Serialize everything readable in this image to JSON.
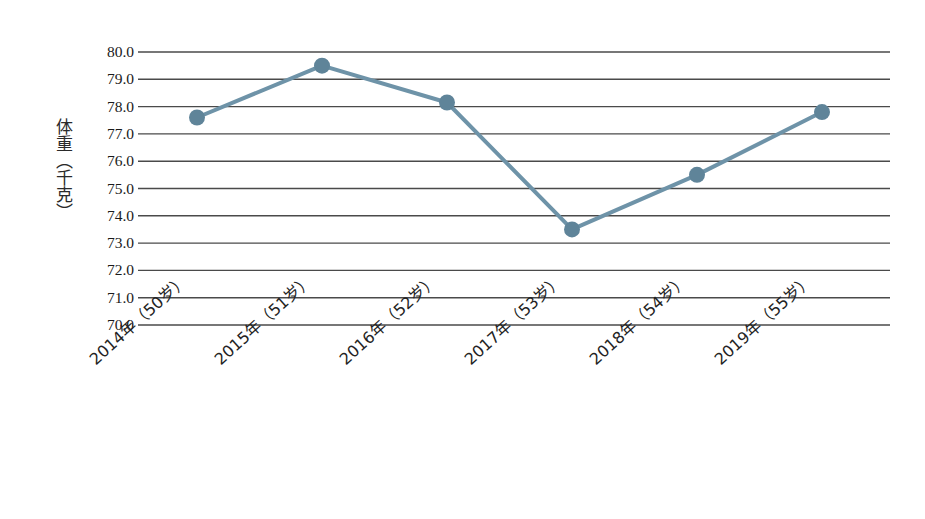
{
  "chart_data": {
    "type": "line",
    "title": "",
    "subtitle": "",
    "xlabel": "",
    "ylabel": "体重（千克）",
    "categories": [
      "2014年（50岁）",
      "2015年（51岁）",
      "2016年（52岁）",
      "2017年（53岁）",
      "2018年（54岁）",
      "2019年（55岁）"
    ],
    "values": [
      77.6,
      79.5,
      78.15,
      73.5,
      75.5,
      77.8
    ],
    "series": [
      {
        "name": "体重",
        "values": [
          77.6,
          79.5,
          78.15,
          73.5,
          75.5,
          77.8
        ]
      }
    ],
    "ylim": [
      70.0,
      80.0
    ],
    "ytick_step": 1.0,
    "ytick_labels": [
      "80.0",
      "79.0",
      "78.0",
      "77.0",
      "76.0",
      "75.0",
      "74.0",
      "73.0",
      "72.0",
      "71.0",
      "70.0"
    ],
    "ytick_values": [
      80.0,
      79.0,
      78.0,
      77.0,
      76.0,
      75.0,
      74.0,
      73.0,
      72.0,
      71.0,
      70.0
    ],
    "grid": {
      "horizontal": true,
      "vertical": false
    },
    "legend": {
      "visible": false,
      "position": "none"
    },
    "axis_lines": {
      "y_axis_visible": false,
      "x_axis_visible": false
    },
    "xtick_rotation_deg": -42,
    "colors": {
      "line": "#6e93a8",
      "marker": "#5f8499",
      "gridline": "#4a4a4a",
      "text": "#1a1a1a",
      "background": "#ffffff"
    },
    "style": {
      "line_width_px": 4,
      "marker_shape": "circle",
      "marker_radius_px": 8
    }
  }
}
